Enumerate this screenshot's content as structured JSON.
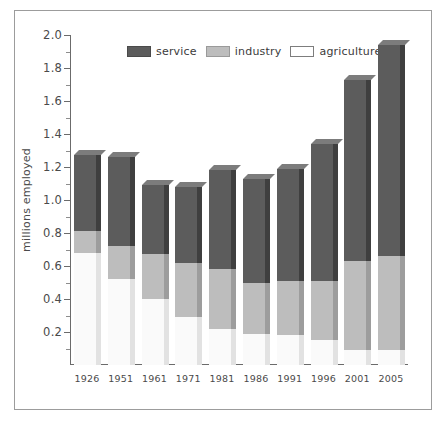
{
  "chart_data": {
    "type": "bar",
    "subtype": "stacked-vertical-3d",
    "title": "",
    "xlabel": "",
    "ylabel": "millions employed",
    "ylim": [
      0.0,
      2.0
    ],
    "y_major_step": 0.2,
    "y_minor_step": 0.1,
    "grid": false,
    "legend_position": "top-center",
    "categories": [
      "1926",
      "1951",
      "1961",
      "1971",
      "1981",
      "1986",
      "1991",
      "1996",
      "2001",
      "2005"
    ],
    "tick_labels": [
      "0.2",
      "0.4",
      "0.6",
      "0.8",
      "1.0",
      "1.2",
      "1.4",
      "1.6",
      "1.8",
      "2.0"
    ],
    "tick_values": [
      0.2,
      0.4,
      0.6,
      0.8,
      1.0,
      1.2,
      1.4,
      1.6,
      1.8,
      2.0
    ],
    "series": [
      {
        "name": "agriculture",
        "color": "#fafafa",
        "values": [
          0.68,
          0.52,
          0.4,
          0.29,
          0.22,
          0.19,
          0.18,
          0.15,
          0.09,
          0.09
        ]
      },
      {
        "name": "industry",
        "color": "#bdbdbd",
        "values": [
          0.13,
          0.2,
          0.27,
          0.33,
          0.36,
          0.31,
          0.33,
          0.36,
          0.54,
          0.57
        ]
      },
      {
        "name": "service",
        "color": "#5c5c5c",
        "values": [
          0.46,
          0.54,
          0.42,
          0.46,
          0.6,
          0.63,
          0.68,
          0.83,
          1.1,
          1.28
        ]
      }
    ],
    "stack_tops": [
      1.27,
      1.26,
      1.09,
      1.08,
      1.18,
      1.13,
      1.19,
      1.34,
      1.73,
      1.94
    ],
    "boundaries_agriculture_industry": [
      0.68,
      0.52,
      0.4,
      0.29,
      0.22,
      0.19,
      0.18,
      0.15,
      0.09,
      0.09
    ],
    "boundaries_industry_service": [
      0.81,
      0.72,
      0.67,
      0.62,
      0.58,
      0.5,
      0.51,
      0.51,
      0.63,
      0.66
    ]
  },
  "legend": {
    "items": [
      {
        "label": "service",
        "color": "#5c5c5c"
      },
      {
        "label": "industry",
        "color": "#bdbdbd"
      },
      {
        "label": "agriculture",
        "color": "#ffffff"
      }
    ]
  },
  "axes": {
    "y_title": "millions employed"
  },
  "colors": {
    "service": "#5c5c5c",
    "industry": "#bdbdbd",
    "agriculture": "#fafafa",
    "axis": "#6b6b6b",
    "frame": "#9c9c9c",
    "text": "#4a4a4a",
    "background": "#ffffff"
  }
}
